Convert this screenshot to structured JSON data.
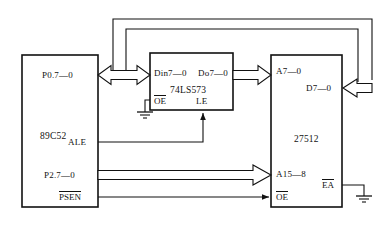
{
  "diagram": {
    "type": "circuit-block-diagram",
    "background_color": "#ffffff",
    "line_color": "#111111",
    "blocks": [
      {
        "id": "mcu",
        "name": "89C52",
        "label": "89C52",
        "x": 22,
        "y": 55,
        "w": 76,
        "h": 152,
        "pins": [
          {
            "name": "P0.7-0",
            "label": "P0.7—0",
            "side": "right",
            "y": 75,
            "overline": false
          },
          {
            "name": "ALE",
            "label": "ALE",
            "side": "right",
            "y": 142,
            "overline": false
          },
          {
            "name": "P2.7-0",
            "label": "P2.7—0",
            "side": "right",
            "y": 175,
            "overline": false
          },
          {
            "name": "PSEN",
            "label": "PSEN",
            "side": "right",
            "y": 197,
            "overline": true
          }
        ]
      },
      {
        "id": "latch",
        "name": "74LS573",
        "label": "74LS573",
        "x": 150,
        "y": 53,
        "w": 83,
        "h": 57,
        "pins": [
          {
            "name": "Din7-0",
            "label": "Din7—0",
            "side": "left-top",
            "overline": false
          },
          {
            "name": "Do7-0",
            "label": "Do7—0",
            "side": "right-top",
            "overline": false
          },
          {
            "name": "OE",
            "label": "OE",
            "side": "left-bottom",
            "overline": true
          },
          {
            "name": "LE",
            "label": "LE",
            "side": "mid-bottom",
            "overline": false
          }
        ]
      },
      {
        "id": "eprom",
        "name": "27512",
        "label": "27512",
        "x": 271,
        "y": 55,
        "w": 71,
        "h": 152,
        "pins": [
          {
            "name": "A7-0",
            "label": "A7—0",
            "side": "left",
            "y": 72,
            "overline": false
          },
          {
            "name": "D7-0",
            "label": "D7—0",
            "side": "right",
            "y": 88,
            "overline": false
          },
          {
            "name": "A15-8",
            "label": "A15—8",
            "side": "left",
            "y": 175,
            "overline": false
          },
          {
            "name": "OE",
            "label": "OE",
            "side": "left",
            "y": 197,
            "overline": true
          },
          {
            "name": "EA",
            "label": "EA",
            "side": "right",
            "y": 185,
            "overline": true
          }
        ]
      }
    ],
    "connections": [
      {
        "name": "p0-to-din-bidirectional-bus",
        "style": "block-arrow-bidirectional",
        "from": "mcu.P0.7-0",
        "to": "latch.Din7-0"
      },
      {
        "name": "do-to-a7-bus",
        "style": "block-arrow-right",
        "from": "latch.Do7-0",
        "to": "eprom.A7-0"
      },
      {
        "name": "d7-data-feedback-outer",
        "style": "block-arrow-left",
        "from": "eprom.D7-0",
        "to": "mcu.P0.7-0"
      },
      {
        "name": "d7-data-feedback-inner",
        "style": "line",
        "from": "eprom.D7-0",
        "to": "mcu.P0.7-0"
      },
      {
        "name": "ale-to-le",
        "style": "line-arrow",
        "from": "mcu.ALE",
        "to": "latch.LE"
      },
      {
        "name": "p2-to-a15-bus",
        "style": "block-arrow-right",
        "from": "mcu.P2.7-0",
        "to": "eprom.A15-8"
      },
      {
        "name": "psen-to-oe",
        "style": "line-arrow",
        "from": "mcu.PSEN",
        "to": "eprom.OE"
      },
      {
        "name": "latch-oe-to-ground",
        "style": "line",
        "from": "latch.OE",
        "to": "ground-latch"
      },
      {
        "name": "ea-to-ground",
        "style": "line",
        "from": "eprom.EA",
        "to": "ground-eprom"
      }
    ],
    "grounds": [
      {
        "name": "ground-latch",
        "x": 145,
        "y": 112
      },
      {
        "name": "ground-eprom",
        "x": 364,
        "y": 196
      }
    ]
  }
}
